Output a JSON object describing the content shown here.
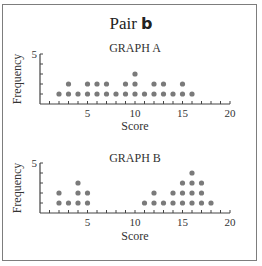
{
  "title": {
    "prefix": "Pair",
    "letter": "b"
  },
  "colors": {
    "dot": "#7a7a7a",
    "axis": "#444444",
    "frame": "#7d7d7d"
  },
  "chart_data": [
    {
      "type": "scatter",
      "subtype": "dot-plot",
      "title": "GRAPH A",
      "xlabel": "Score",
      "ylabel": "Frequency",
      "xlim": [
        0,
        20
      ],
      "ylim": [
        0,
        5
      ],
      "xticks": [
        5,
        10,
        15,
        20
      ],
      "yticks": [
        5
      ],
      "x": [
        2,
        3,
        4,
        5,
        6,
        7,
        8,
        9,
        10,
        11,
        12,
        13,
        14,
        15,
        16
      ],
      "frequency": [
        1,
        2,
        1,
        2,
        2,
        2,
        1,
        2,
        3,
        1,
        2,
        2,
        1,
        2,
        1
      ],
      "grid": false,
      "legend": null
    },
    {
      "type": "scatter",
      "subtype": "dot-plot",
      "title": "GRAPH B",
      "xlabel": "Score",
      "ylabel": "Frequency",
      "xlim": [
        0,
        20
      ],
      "ylim": [
        0,
        5
      ],
      "xticks": [
        5,
        10,
        15,
        20
      ],
      "yticks": [
        5
      ],
      "x": [
        2,
        3,
        4,
        5,
        11,
        12,
        13,
        14,
        15,
        16,
        17,
        18
      ],
      "frequency": [
        2,
        1,
        3,
        2,
        1,
        2,
        1,
        2,
        3,
        4,
        3,
        1
      ],
      "grid": false,
      "legend": null
    }
  ]
}
